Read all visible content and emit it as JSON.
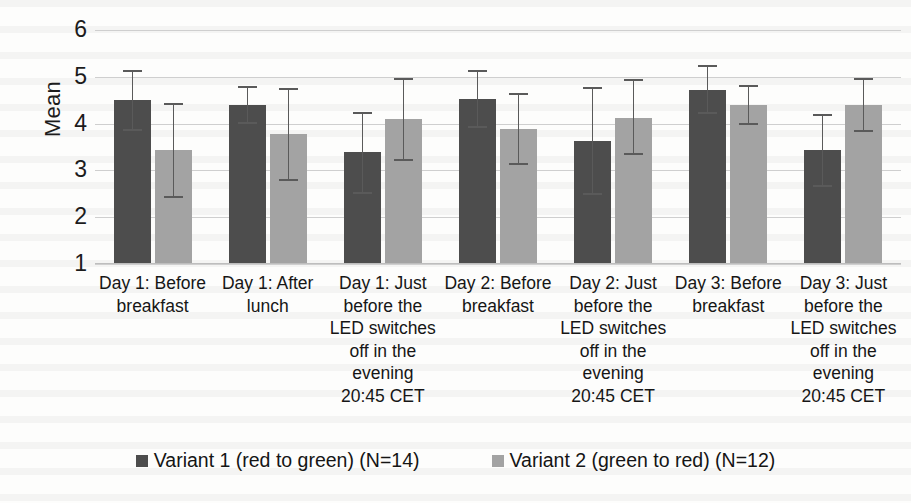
{
  "chart_data": {
    "type": "bar",
    "title": "",
    "xlabel": "",
    "ylabel": "Mean",
    "ylim": [
      1,
      6
    ],
    "yticks": [
      1,
      2,
      3,
      4,
      5,
      6
    ],
    "grid": true,
    "legend_position": "bottom",
    "error_bars": "shown",
    "categories": [
      "Day 1: Before breakfast",
      "Day 1: After lunch",
      "Day 1: Just before the LED switches off in the evening 20:45 CET",
      "Day 2: Before breakfast",
      "Day 2: Just before the LED switches off in the evening 20:45 CET",
      "Day 3: Before breakfast",
      "Day 3: Just before the LED switches off in the evening 20:45 CET"
    ],
    "series": [
      {
        "name": "Variant 1 (red to green) (N=14)",
        "color": "#4d4d4d",
        "values": [
          4.5,
          4.4,
          3.4,
          4.53,
          3.63,
          4.72,
          3.43
        ],
        "err_low": [
          3.85,
          4.0,
          2.5,
          3.9,
          2.48,
          4.2,
          2.65
        ],
        "err_high": [
          5.15,
          4.8,
          4.25,
          5.15,
          4.78,
          5.25,
          4.2
        ]
      },
      {
        "name": "Variant 2 (green to red) (N=12)",
        "color": "#a3a3a3",
        "values": [
          3.43,
          3.78,
          4.1,
          3.88,
          4.13,
          4.4,
          4.4
        ],
        "err_low": [
          2.42,
          2.78,
          3.2,
          3.12,
          3.33,
          3.98,
          3.82
        ],
        "err_high": [
          4.45,
          4.77,
          4.98,
          4.65,
          4.95,
          4.82,
          4.98
        ]
      }
    ]
  },
  "axis": {
    "y_title": "Mean",
    "y_tick_labels": [
      "6",
      "5",
      "4",
      "3",
      "2",
      "1"
    ]
  },
  "legend": {
    "items": [
      {
        "label": "Variant 1 (red to green) (N=14)",
        "color": "#4d4d4d"
      },
      {
        "label": "Variant 2 (green to red) (N=12)",
        "color": "#a3a3a3"
      }
    ]
  }
}
